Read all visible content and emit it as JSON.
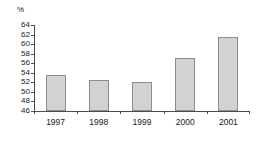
{
  "chart_data": {
    "type": "bar",
    "title": "",
    "subtitle": "",
    "xlabel": "",
    "ylabel": "%",
    "unit_label": "%",
    "categories": [
      "1997",
      "1998",
      "1999",
      "2000",
      "2001"
    ],
    "values": [
      53.5,
      52.5,
      52.1,
      57.2,
      61.5
    ],
    "series": [
      {
        "name": "",
        "values": [
          53.5,
          52.5,
          52.1,
          57.2,
          61.5
        ]
      }
    ],
    "ylim": [
      46,
      64
    ],
    "ytick_step": 2,
    "ytick_labels": [
      "46",
      "48",
      "50",
      "52",
      "54",
      "56",
      "58",
      "60",
      "62",
      "64"
    ],
    "ytick_values": [
      46,
      48,
      50,
      52,
      54,
      56,
      58,
      60,
      62,
      64
    ],
    "grid": false,
    "legend": false,
    "legend_position": "none",
    "orientation": "vertical",
    "colors": {
      "bar_fill": "#d2d2d2",
      "bar_border": "#8c8c8c",
      "axis": "#4d4d4d",
      "text": "#1a1a1a",
      "background": "#ffffff"
    }
  }
}
